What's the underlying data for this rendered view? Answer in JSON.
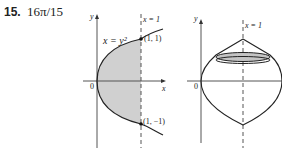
{
  "problem": {
    "number": "15.",
    "answer": "16π/15"
  },
  "figure_left": {
    "y_axis_label": "y",
    "x_axis_label": "x",
    "origin_label": "0",
    "curve_label": "x = y²",
    "line_label": "x = 1",
    "point_top": "(1, 1)",
    "point_bottom": "(1, −1)",
    "shade_color": "#cfcfcf"
  },
  "figure_right": {
    "y_axis_label": "y",
    "origin_label": "0",
    "line_label": "x = 1",
    "disk_color": "#bdbdbd"
  }
}
